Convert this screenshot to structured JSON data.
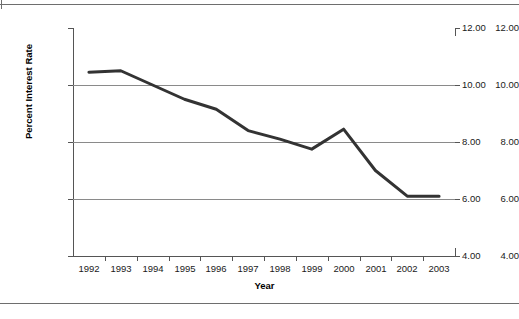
{
  "chart_data": {
    "type": "line",
    "title": "",
    "xlabel": "Year",
    "ylabel": "Percent Interest Rate",
    "categories": [
      "1992",
      "1993",
      "1994",
      "1995",
      "1996",
      "1997",
      "1998",
      "1999",
      "2000",
      "2001",
      "2002",
      "2003"
    ],
    "x": [
      1992,
      1993,
      1994,
      1995,
      1996,
      1997,
      1998,
      1999,
      2000,
      2001,
      2002,
      2003
    ],
    "values": [
      10.45,
      10.5,
      10.0,
      9.5,
      9.15,
      8.4,
      8.1,
      7.75,
      8.45,
      7.0,
      6.1,
      6.1
    ],
    "series": [
      {
        "name": "Percent Interest Rate",
        "values": [
          10.45,
          10.5,
          10.0,
          9.5,
          9.15,
          8.4,
          8.1,
          7.75,
          8.45,
          7.0,
          6.1,
          6.1
        ]
      }
    ],
    "ylim": [
      4.0,
      12.0
    ],
    "yticks": [
      4.0,
      6.0,
      8.0,
      10.0,
      12.0
    ],
    "ytick_labels": [
      "4.00",
      "6.00",
      "8.00",
      "10.00",
      "12.00"
    ],
    "right_axis_labels": [
      "4.00",
      "6.00",
      "8.00",
      "10.00",
      "12.00"
    ],
    "grid": true,
    "grid_axis": "y",
    "legend": false,
    "legend_position": "none",
    "line_color": "#333333",
    "line_width": 3,
    "grid_color": "#8a8a8a",
    "axis_color": "#555555",
    "background_color": "#ffffff"
  },
  "figure": {
    "top_rule": "",
    "bottom_rule": ""
  }
}
